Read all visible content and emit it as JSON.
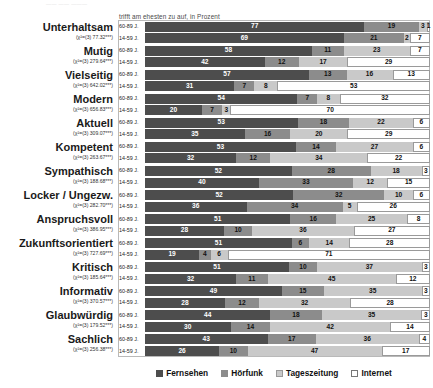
{
  "top_ghost_text": "—— —— ———",
  "axis_title": "trifft am ehesten zu auf, in Prozent",
  "legend": {
    "items": [
      {
        "label": "Fernsehen",
        "color": "#4d4d4d"
      },
      {
        "label": "Hörfunk",
        "color": "#8c8c8c"
      },
      {
        "label": "Tageszeitung",
        "color": "#c9c9c9"
      },
      {
        "label": "Internet",
        "color": "#ffffff"
      }
    ]
  },
  "age_groups": [
    "60-89 J.",
    "14-59 J."
  ],
  "chart_data": {
    "type": "bar",
    "title": "trifft am ehesten zu auf, in Prozent",
    "xlabel": "Prozent",
    "ylabel": "",
    "xlim": [
      0,
      100
    ],
    "grid": false,
    "legend_position": "bottom",
    "stacked": true,
    "orientation": "horizontal",
    "legend_entries": [
      "Fernsehen",
      "Hörfunk",
      "Tageszeitung",
      "Internet"
    ],
    "series": [
      {
        "name": "Fernsehen",
        "color": "#4d4d4d"
      },
      {
        "name": "Hörfunk",
        "color": "#8c8c8c"
      },
      {
        "name": "Tageszeitung",
        "color": "#c9c9c9"
      },
      {
        "name": "Internet",
        "color": "#ffffff"
      }
    ],
    "categories": [
      {
        "label": "Unterhaltsam",
        "stat": "(χ²=(3) 77.32***)",
        "rows": [
          {
            "age": "60-89 J.",
            "values": [
              77,
              19,
              3,
              1
            ]
          },
          {
            "age": "14-59 J.",
            "values": [
              69,
              21,
              2,
              7
            ]
          }
        ]
      },
      {
        "label": "Mutig",
        "stat": "(χ²=(3) 279.64***)",
        "rows": [
          {
            "age": "60-89 J.",
            "values": [
              58,
              11,
              23,
              7
            ]
          },
          {
            "age": "14-59 J.",
            "values": [
              42,
              12,
              17,
              29
            ]
          }
        ]
      },
      {
        "label": "Vielseitig",
        "stat": "(χ²=(3) 642.02***)",
        "rows": [
          {
            "age": "60-89 J.",
            "values": [
              57,
              13,
              16,
              13
            ]
          },
          {
            "age": "14-59 J.",
            "values": [
              31,
              7,
              8,
              53
            ]
          }
        ]
      },
      {
        "label": "Modern",
        "stat": "(χ²=(3) 656.83***)",
        "rows": [
          {
            "age": "60-89 J.",
            "values": [
              54,
              7,
              8,
              32
            ]
          },
          {
            "age": "14-59 J.",
            "values": [
              20,
              7,
              3,
              70
            ]
          }
        ]
      },
      {
        "label": "Aktuell",
        "stat": "(χ²=(3) 309.07***)",
        "rows": [
          {
            "age": "60-89 J.",
            "values": [
              53,
              18,
              22,
              6
            ]
          },
          {
            "age": "14-59 J.",
            "values": [
              35,
              16,
              20,
              29
            ]
          }
        ]
      },
      {
        "label": "Kompetent",
        "stat": "(χ²=(3) 263.67***)",
        "rows": [
          {
            "age": "60-89 J.",
            "values": [
              53,
              14,
              27,
              6
            ]
          },
          {
            "age": "14-59 J.",
            "values": [
              32,
              12,
              34,
              22
            ]
          }
        ]
      },
      {
        "label": "Sympathisch",
        "stat": "(χ²=(3) 188.68***)",
        "rows": [
          {
            "age": "60-89 J.",
            "values": [
              52,
              28,
              18,
              3
            ]
          },
          {
            "age": "14-59 J.",
            "values": [
              40,
              33,
              12,
              15
            ]
          }
        ]
      },
      {
        "label": "Locker / Ungezw.",
        "stat": "(χ²=(3) 282.70***)",
        "rows": [
          {
            "age": "60-89 J.",
            "values": [
              52,
              32,
              10,
              6
            ]
          },
          {
            "age": "14-59 J.",
            "values": [
              36,
              34,
              5,
              26
            ]
          }
        ]
      },
      {
        "label": "Anspruchsvoll",
        "stat": "(χ²=(3) 386.95***)",
        "rows": [
          {
            "age": "60-89 J.",
            "values": [
              51,
              16,
              25,
              8
            ]
          },
          {
            "age": "14-59 J.",
            "values": [
              28,
              10,
              36,
              27
            ]
          }
        ]
      },
      {
        "label": "Zukunftsorientiert",
        "stat": "(χ²=(3) 727.69***)",
        "rows": [
          {
            "age": "60-89 J.",
            "values": [
              51,
              6,
              14,
              28
            ]
          },
          {
            "age": "14-59 J.",
            "values": [
              19,
              4,
              6,
              71
            ]
          }
        ]
      },
      {
        "label": "Kritisch",
        "stat": "(χ²=(3) 185.64***)",
        "rows": [
          {
            "age": "60-89 J.",
            "values": [
              51,
              10,
              37,
              3
            ]
          },
          {
            "age": "14-59 J.",
            "values": [
              32,
              11,
              45,
              12
            ]
          }
        ]
      },
      {
        "label": "Informativ",
        "stat": "(χ²=(3) 370.57***)",
        "rows": [
          {
            "age": "60-89 J.",
            "values": [
              49,
              15,
              35,
              3
            ]
          },
          {
            "age": "14-59 J.",
            "values": [
              28,
              12,
              32,
              28
            ]
          }
        ]
      },
      {
        "label": "Glaubwürdig",
        "stat": "(χ²=(3) 179.52***)",
        "rows": [
          {
            "age": "60-89 J.",
            "values": [
              44,
              18,
              35,
              3
            ]
          },
          {
            "age": "14-59 J.",
            "values": [
              30,
              14,
              42,
              14
            ]
          }
        ]
      },
      {
        "label": "Sachlich",
        "stat": "(χ²=(3) 256.38***)",
        "rows": [
          {
            "age": "60-89 J.",
            "values": [
              43,
              17,
              36,
              4
            ]
          },
          {
            "age": "14-59 J.",
            "values": [
              26,
              10,
              47,
              17
            ]
          }
        ]
      }
    ]
  }
}
